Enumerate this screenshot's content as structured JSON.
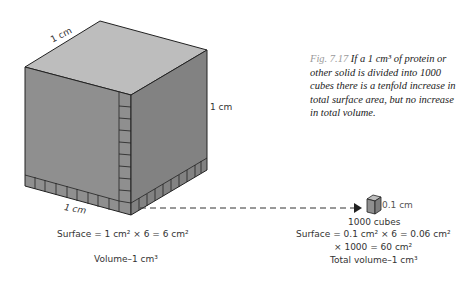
{
  "caption": {
    "figure_number": "Fig. 7.17",
    "text": "If a 1 cm³ of protein or other solid is divided into 1000 cubes there is a tenfold increase in total surface area, but no increase in total volume."
  },
  "large_cube": {
    "edge_label_top": "1 cm",
    "edge_label_right": "1 cm",
    "edge_label_bottom": "1 cm",
    "surface_text": "Surface = 1 cm² × 6 = 6 cm²",
    "volume_text": "Volume–1 cm³",
    "colors": {
      "top": "#b9b9b9",
      "left": "#8e8e8e",
      "right": "#808080",
      "edge": "#222222"
    }
  },
  "small_cube": {
    "edge_label": "0.1 cm",
    "count_text": "1000 cubes",
    "surface_text": "Surface = 0.1 cm² × 6 = 0.06 cm²",
    "multiplier_text": "× 1000 = 60 cm²",
    "total_volume_text": "Total volume–1 cm³"
  }
}
